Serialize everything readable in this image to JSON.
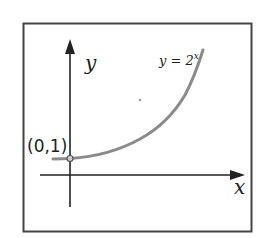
{
  "diagram": {
    "type": "function-graph",
    "function_label": "y = 2",
    "function_exponent": "x",
    "x_axis_label": "x",
    "y_axis_label": "y",
    "point_label": "(0,1)",
    "colors": {
      "frame": "#444444",
      "axes": "#222222",
      "curve": "#8a8a8a",
      "text": "#222222"
    }
  }
}
